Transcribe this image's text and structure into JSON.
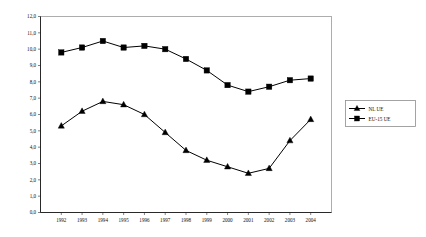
{
  "chart_data": {
    "type": "line",
    "title": "",
    "subtitle": "",
    "xlabel": "",
    "ylabel": "",
    "categories": [
      "1992",
      "1993",
      "1994",
      "1995",
      "1996",
      "1997",
      "1998",
      "1999",
      "2000",
      "2001",
      "2002",
      "2003",
      "2004"
    ],
    "series": [
      {
        "name": "NL UE",
        "marker": "triangle",
        "color": "#000000",
        "values": [
          5.3,
          6.2,
          6.8,
          6.6,
          6.0,
          4.9,
          3.8,
          3.2,
          2.8,
          2.4,
          2.7,
          4.4,
          5.7
        ]
      },
      {
        "name": "EU-15 UE",
        "marker": "square",
        "color": "#000000",
        "values": [
          9.8,
          10.1,
          10.5,
          10.1,
          10.2,
          10.0,
          9.4,
          8.7,
          7.8,
          7.4,
          7.7,
          8.1,
          8.2
        ]
      }
    ],
    "ylim": [
      0.0,
      12.0
    ],
    "ytick_step": 1.0,
    "ytick_labels": [
      "0,0",
      "1,0",
      "2,0",
      "3,0",
      "4,0",
      "5,0",
      "6,0",
      "7,0",
      "8,0",
      "9,0",
      "10,0",
      "11,0",
      "12,0"
    ],
    "xtick_labels": [
      "1992",
      "1993",
      "1994",
      "1995",
      "1996",
      "1997",
      "1998",
      "1999",
      "2000",
      "2001",
      "2002",
      "2003",
      "2004"
    ],
    "grid": false,
    "legend_position": "right-outside",
    "legend_entries": [
      "NL UE",
      "EU-15 UE"
    ],
    "plot_background": "#ffffff",
    "border_color": "#9a9a9a"
  }
}
